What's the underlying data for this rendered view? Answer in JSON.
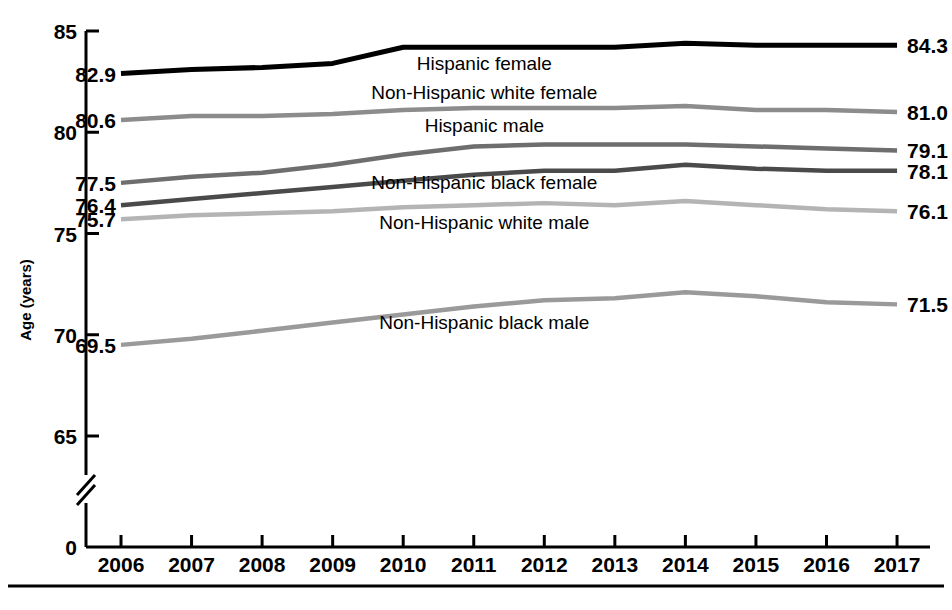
{
  "chart_data": {
    "type": "line",
    "title": "",
    "xlabel": "",
    "ylabel": "Age (years)",
    "grid": false,
    "legend_position": "inline-labels",
    "x": [
      2006,
      2007,
      2008,
      2009,
      2010,
      2011,
      2012,
      2013,
      2014,
      2015,
      2016,
      2017
    ],
    "x_tick_labels": [
      "2006",
      "2007",
      "2008",
      "2009",
      "2010",
      "2011",
      "2012",
      "2013",
      "2014",
      "2015",
      "2016",
      "2017"
    ],
    "y_tick_labels": [
      "0",
      "65",
      "70",
      "75",
      "80",
      "85"
    ],
    "y_ticks": [
      0,
      65,
      70,
      75,
      80,
      85
    ],
    "ylim": [
      64.0,
      85.0
    ],
    "axis_break": true,
    "axis_break_note": "y-axis broken between 0 and 65",
    "series": [
      {
        "name": "Hispanic female",
        "color": "#000000",
        "width": 5.0,
        "start_value": "82.9",
        "end_value": "84.3",
        "values": [
          82.9,
          83.1,
          83.2,
          83.4,
          84.2,
          84.2,
          84.2,
          84.2,
          84.4,
          84.3,
          84.3,
          84.3
        ],
        "label_x": 2011.15,
        "label_y": 83.35
      },
      {
        "name": "Non-Hispanic white female",
        "color": "#8c8c8c",
        "width": 4.5,
        "start_value": "80.6",
        "end_value": "81.0",
        "values": [
          80.6,
          80.8,
          80.8,
          80.9,
          81.1,
          81.2,
          81.2,
          81.2,
          81.3,
          81.1,
          81.1,
          81.0
        ],
        "label_x": 2011.15,
        "label_y": 81.95
      },
      {
        "name": "Hispanic male",
        "color": "#6e6e6e",
        "width": 4.5,
        "start_value": "77.5",
        "end_value": "79.1",
        "values": [
          77.5,
          77.8,
          78.0,
          78.4,
          78.9,
          79.3,
          79.4,
          79.4,
          79.4,
          79.3,
          79.2,
          79.1
        ],
        "label_x": 2011.15,
        "label_y": 80.3
      },
      {
        "name": "Non-Hispanic black female",
        "color": "#4a4a4a",
        "width": 4.5,
        "start_value": "76.4",
        "end_value": "78.1",
        "values": [
          76.4,
          76.7,
          77.0,
          77.3,
          77.6,
          77.9,
          78.1,
          78.1,
          78.4,
          78.2,
          78.1,
          78.1
        ],
        "label_x": 2011.15,
        "label_y": 77.5
      },
      {
        "name": "Non-Hispanic white male",
        "color": "#b4b4b4",
        "width": 4.5,
        "start_value": "75.7",
        "end_value": "76.1",
        "values": [
          75.7,
          75.9,
          76.0,
          76.1,
          76.3,
          76.4,
          76.5,
          76.4,
          76.6,
          76.4,
          76.2,
          76.1
        ],
        "label_x": 2011.15,
        "label_y": 75.5
      },
      {
        "name": "Non-Hispanic black male",
        "color": "#9a9a9a",
        "width": 4.5,
        "start_value": "69.5",
        "end_value": "71.5",
        "values": [
          69.5,
          69.8,
          70.2,
          70.6,
          71.0,
          71.4,
          71.7,
          71.8,
          72.1,
          71.9,
          71.6,
          71.5
        ],
        "label_x": 2011.15,
        "label_y": 70.6
      }
    ],
    "start_labels": [
      {
        "text": "82.9",
        "value": 82.9
      },
      {
        "text": "80.6",
        "value": 80.6
      },
      {
        "text": "77.5",
        "value": 77.5
      },
      {
        "text": "76.4",
        "value": 76.4
      },
      {
        "text": "75.7",
        "value": 75.7
      },
      {
        "text": "69.5",
        "value": 69.5
      }
    ],
    "end_labels": [
      {
        "text": "84.3",
        "value": 84.3
      },
      {
        "text": "81.0",
        "value": 81.0
      },
      {
        "text": "79.1",
        "value": 79.1
      },
      {
        "text": "78.1",
        "value": 78.1
      },
      {
        "text": "76.1",
        "value": 76.1
      },
      {
        "text": "71.5",
        "value": 71.5
      }
    ]
  }
}
